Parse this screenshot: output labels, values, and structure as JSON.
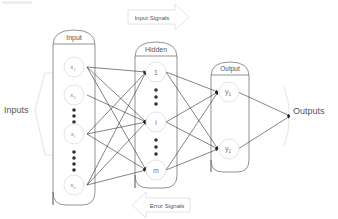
{
  "diagram": {
    "caption_fragment": "...",
    "side_labels": {
      "inputs": "Inputs",
      "outputs": "Outputs"
    },
    "signals": {
      "forward": "Input Signals",
      "backward": "Error Signals"
    },
    "layers": [
      {
        "id": "input",
        "title": "Input",
        "nodes": [
          "x1",
          "x2",
          "xi",
          "xn"
        ]
      },
      {
        "id": "hidden",
        "title": "Hidden",
        "nodes": [
          "1",
          "i",
          "m"
        ]
      },
      {
        "id": "output",
        "title": "Output",
        "nodes": [
          "y1",
          "y2"
        ]
      }
    ],
    "node_labels": {
      "x1": "x",
      "x1_sub": "1",
      "x2": "x",
      "x2_sub": "2",
      "xi": "x",
      "xi_sub": "i",
      "xn": "x",
      "xn_sub": "n",
      "h1": "1",
      "hi": "i",
      "hm": "m",
      "y1": "y",
      "y1_sub": "1",
      "y2": "y",
      "y2_sub": "2"
    },
    "colors": {
      "line": "#333333",
      "box": "#777777",
      "node": "#dddddd",
      "text": "#555555",
      "faint": "#cccccc"
    }
  }
}
